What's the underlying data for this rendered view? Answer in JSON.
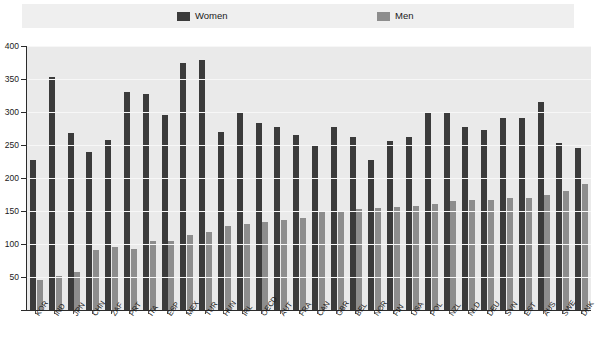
{
  "legend": {
    "entries": [
      {
        "label": "Women",
        "color": "#3b3b3b",
        "icon": "square-swatch-icon"
      },
      {
        "label": "Men",
        "color": "#8d8d8d",
        "icon": "square-swatch-icon"
      }
    ]
  },
  "axis": {
    "y_ticks": [
      "400",
      "350",
      "300",
      "250",
      "200",
      "150",
      "100",
      "50",
      "0"
    ]
  },
  "chart_data": {
    "type": "bar",
    "title": "",
    "subtitle": "",
    "xlabel": "",
    "ylabel": "",
    "ylim": [
      0,
      400
    ],
    "ytick_step": 50,
    "grid": true,
    "legend_position": "top",
    "categories": [
      "KOR",
      "IND",
      "JPN",
      "CHN",
      "ZAF",
      "PRT",
      "ITA",
      "ESP",
      "MEX",
      "TUR",
      "HUN",
      "IRL",
      "OECD",
      "AUT",
      "FRA",
      "CAN",
      "GBR",
      "BEL",
      "NOR",
      "FIN",
      "USA",
      "POL",
      "NZL",
      "NLD",
      "DEU",
      "SVN",
      "EST",
      "AUS",
      "SWE",
      "DNK"
    ],
    "series": [
      {
        "name": "Women",
        "color": "#3b3b3b",
        "values": [
          227,
          353,
          268,
          240,
          257,
          330,
          327,
          295,
          374,
          379,
          269,
          298,
          283,
          277,
          265,
          250,
          277,
          262,
          228,
          256,
          262,
          298,
          300,
          277,
          272,
          291,
          291,
          315,
          253,
          245
        ]
      },
      {
        "name": "Men",
        "color": "#8d8d8d",
        "values": [
          45,
          52,
          58,
          91,
          96,
          93,
          105,
          104,
          114,
          118,
          128,
          131,
          134,
          137,
          140,
          150,
          148,
          153,
          155,
          156,
          158,
          161,
          165,
          167,
          167,
          169,
          170,
          174,
          180,
          191
        ]
      }
    ]
  }
}
